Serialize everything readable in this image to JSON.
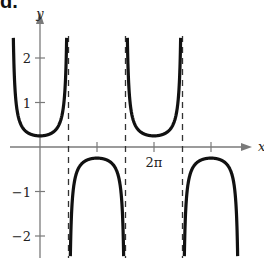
{
  "figure_label": "d.",
  "chart_data": {
    "type": "line",
    "title": "",
    "function": "y = (1/4) sec(x)",
    "xlabel": "x",
    "ylabel": "y",
    "xlim": [
      -1.3,
      7.4
    ],
    "ylim": [
      -2.5,
      2.6
    ],
    "x_ticks": [
      {
        "value": 3.14159,
        "label": ""
      },
      {
        "value": 6.28318,
        "label": "2π"
      },
      {
        "value": 9.42478,
        "label": ""
      }
    ],
    "y_ticks": [
      {
        "value": 2,
        "label": "2"
      },
      {
        "value": 1,
        "label": "1"
      },
      {
        "value": -1,
        "label": "−1"
      },
      {
        "value": -2,
        "label": "−2"
      }
    ],
    "asymptotes": [
      1.5708,
      4.7124,
      7.854
    ],
    "asymptote_style": "dashed",
    "extrema": [
      {
        "x": 0,
        "y": 0.25,
        "type": "min"
      },
      {
        "x": 3.14159,
        "y": -0.25,
        "type": "max"
      },
      {
        "x": 6.28318,
        "y": 0.25,
        "type": "min"
      },
      {
        "x": 9.42478,
        "y": -0.25,
        "type": "max"
      }
    ],
    "grid": false,
    "legend": null
  },
  "geometry": {
    "origin_px": [
      40,
      147
    ],
    "px_per_pi": 57,
    "px_per_unit_y": 44.5,
    "x_axis_left": 10,
    "x_axis_right": 252,
    "y_axis_top": 10,
    "y_axis_bottom": 258
  },
  "colors": {
    "curve": "#111111",
    "axis": "#7a7a7a",
    "asymptote": "#333333",
    "text": "#222222"
  }
}
